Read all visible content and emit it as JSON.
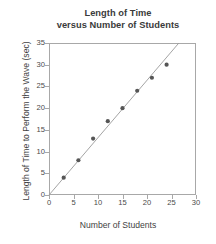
{
  "chart_data": {
    "type": "scatter",
    "title": "Length of Time versus Number of Students",
    "title_lines": [
      "Length of Time",
      "versus Number of Students"
    ],
    "xlabel": "Number of Students",
    "ylabel": "Length of Time to Perform the Wave (sec)",
    "xlim": [
      0,
      30
    ],
    "ylim": [
      0,
      35
    ],
    "xticks": [
      0,
      5,
      10,
      15,
      20,
      25,
      30
    ],
    "yticks": [
      0,
      5,
      10,
      15,
      20,
      25,
      30,
      35
    ],
    "xtick_labels": [
      "0",
      "5",
      "10",
      "15",
      "20",
      "25",
      "30"
    ],
    "ytick_labels": [
      "0",
      "5",
      "10",
      "15",
      "20",
      "25",
      "30",
      "35"
    ],
    "grid": false,
    "legend": false,
    "legend_position": "none",
    "x": [
      3,
      6,
      9,
      12,
      15,
      18,
      21,
      24
    ],
    "values": [
      4,
      8,
      13,
      17,
      20,
      24,
      27,
      30
    ],
    "points": [
      {
        "x": 3,
        "y": 4
      },
      {
        "x": 6,
        "y": 8
      },
      {
        "x": 9,
        "y": 13
      },
      {
        "x": 12,
        "y": 17
      },
      {
        "x": 15,
        "y": 20
      },
      {
        "x": 18,
        "y": 24
      },
      {
        "x": 21,
        "y": 27
      },
      {
        "x": 24,
        "y": 30
      }
    ],
    "trend_line": {
      "type": "line-of-best-fit",
      "slope": 1.32,
      "intercept": 0,
      "x_start": 0,
      "y_start": 0,
      "x_end": 26.5,
      "y_end": 35
    },
    "marker_color": "#555555",
    "line_color": "#9a9a9a",
    "frame_color": "#a8a8a8",
    "background_color": "#ffffff"
  }
}
